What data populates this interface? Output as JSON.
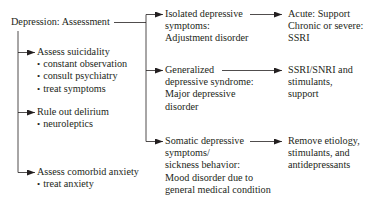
{
  "root": {
    "label": "Depression: Assessment"
  },
  "left_branches": [
    {
      "label": "Assess suicidality",
      "items": [
        "constant observation",
        "consult psychiatry",
        "treat symptoms"
      ]
    },
    {
      "label": "Rule out delirium",
      "items": [
        "neuroleptics"
      ]
    },
    {
      "label": "Assess comorbid anxiety",
      "items": [
        "treat anxiety"
      ]
    }
  ],
  "middle_branches": [
    {
      "lines": [
        "Isolated depressive",
        "symptoms:",
        "Adjustment disorder"
      ]
    },
    {
      "lines": [
        "Generalized",
        "depressive syndrome:",
        "Major depressive",
        "disorder"
      ]
    },
    {
      "lines": [
        "Somatic depressive",
        "symptoms/",
        "sickness behavior:",
        "Mood disorder due to",
        "general medical condition"
      ]
    }
  ],
  "treatments": [
    {
      "lines": [
        "Acute: Support",
        "Chronic or severe:",
        "SSRI"
      ]
    },
    {
      "lines": [
        "SSRI/SNRI and",
        "stimulants,",
        "support"
      ]
    },
    {
      "lines": [
        "Remove etiology,",
        "stimulants, and",
        "antidepressants"
      ]
    }
  ],
  "colors": {
    "text": "#231f20",
    "line": "#231f20",
    "background": "#ffffff"
  }
}
